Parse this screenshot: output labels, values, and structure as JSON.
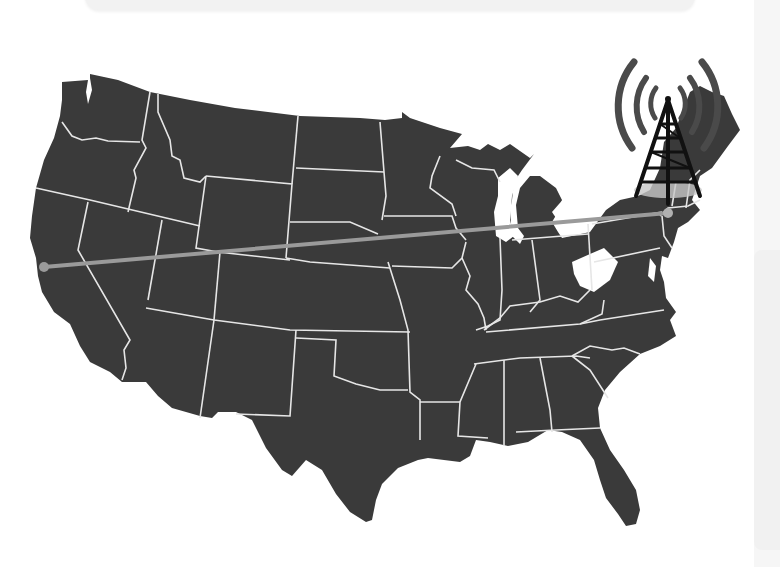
{
  "map": {
    "title": "United States connectivity map",
    "region": "Contiguous United States",
    "fill_color": "#3a3a3a",
    "border_color": "#e6e6e6",
    "background_color": "#ffffff",
    "connection": {
      "color": "#9a9a9a",
      "from": {
        "name": "West Coast (California)",
        "x": 44,
        "y": 267
      },
      "to": {
        "name": "Northeast (New York)",
        "x": 668,
        "y": 213
      }
    },
    "icon": {
      "name": "radio-tower-icon",
      "color": "#1a1a1a",
      "arc_color": "#4a4a4a"
    }
  }
}
